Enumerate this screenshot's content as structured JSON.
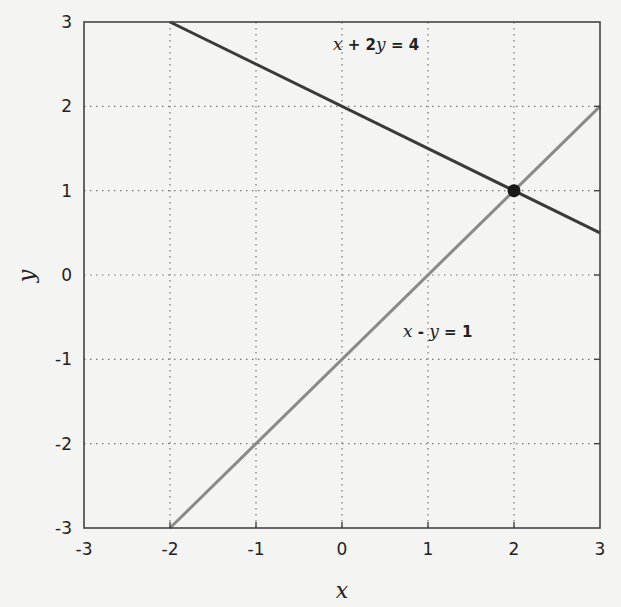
{
  "chart_data": {
    "type": "line",
    "title": "",
    "xlabel": "x",
    "ylabel": "y",
    "xlim": [
      -3,
      3
    ],
    "ylim": [
      -3,
      3
    ],
    "grid": true,
    "grid_style": "dotted",
    "x_ticks": [
      "-3",
      "-2",
      "-1",
      "0",
      "1",
      "2",
      "3"
    ],
    "y_ticks": [
      "3",
      "2",
      "1",
      "0",
      "-1",
      "-2",
      "-3"
    ],
    "series": [
      {
        "name": "x + 2y = 4",
        "color": "#3a3a3a",
        "x": [
          -2,
          3
        ],
        "y": [
          3,
          0.5
        ]
      },
      {
        "name": "x - y = 1",
        "color": "#8a8a8a",
        "x": [
          -2,
          3
        ],
        "y": [
          -3,
          2
        ]
      }
    ],
    "points": [
      {
        "name": "intersection",
        "x": 2,
        "y": 1,
        "color": "#1a1a1a"
      }
    ],
    "annotations": [
      {
        "text": "x + 2y = 4",
        "x": 0.25,
        "y": 2.45
      },
      {
        "text": "x - y = 1",
        "x": 1.0,
        "y": -0.6
      }
    ],
    "legend": "none"
  },
  "labels": {
    "eq1": {
      "v1": "x",
      "op": " + 2",
      "v2": "y",
      "rhs": " = 4"
    },
    "eq2": {
      "v1": "x",
      "op": " - ",
      "v2": "y",
      "rhs": " = 1"
    }
  }
}
